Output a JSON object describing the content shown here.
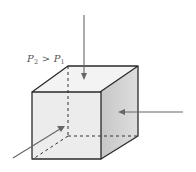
{
  "figure": {
    "label": {
      "lhs_symbol": "P",
      "lhs_subscript": "2",
      "operator": ">",
      "rhs_symbol": "P",
      "rhs_subscript": "1",
      "full_text": "P2 > P1"
    },
    "cube": {
      "faces": {
        "top": "#f3f3f3",
        "front": "#ececec",
        "right_dark": "#c6c6c6",
        "right_light": "#dedede"
      },
      "edge_color": "#2a2a2a",
      "hidden_edge_color": "#333333"
    },
    "arrows": [
      {
        "name": "top-arrow",
        "direction": "down",
        "color": "#666666"
      },
      {
        "name": "right-arrow",
        "direction": "left",
        "color": "#666666"
      },
      {
        "name": "front-left-arrow",
        "direction": "up-right",
        "color": "#666666"
      }
    ]
  }
}
